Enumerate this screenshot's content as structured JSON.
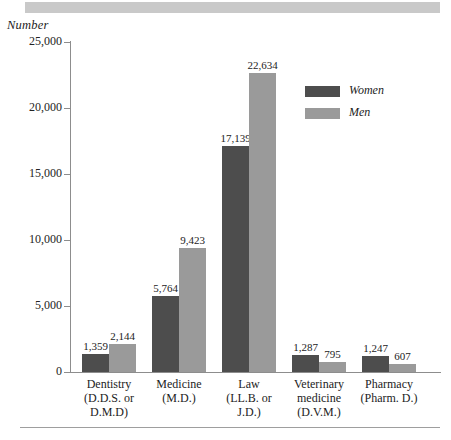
{
  "figure": {
    "axis_title": "Number",
    "top_band_color": "#c9c9c9",
    "bottom_rule_color": "#9e9e9e"
  },
  "legend": {
    "position": "upper-right",
    "entries": [
      {
        "label": "Women",
        "color": "#4d4d4d"
      },
      {
        "label": "Men",
        "color": "#9a9a9a"
      }
    ]
  },
  "yaxis": {
    "ticks": [
      "0",
      "5,000",
      "10,000",
      "15,000",
      "20,000",
      "25,000"
    ],
    "tick_values": [
      0,
      5000,
      10000,
      15000,
      20000,
      25000
    ]
  },
  "categories": [
    {
      "line1": "Dentistry",
      "line2": "(D.D.S. or",
      "line3": "D.M.D)"
    },
    {
      "line1": "Medicine",
      "line2": "(M.D.)",
      "line3": ""
    },
    {
      "line1": "Law",
      "line2": "(LL.B. or",
      "line3": "J.D.)"
    },
    {
      "line1": "Veterinary",
      "line2": "medicine",
      "line3": "(D.V.M.)"
    },
    {
      "line1": "Pharmacy",
      "line2": "(Pharm. D.)",
      "line3": ""
    }
  ],
  "value_labels": {
    "women": [
      "1,359",
      "5,764",
      "17,139",
      "1,287",
      "1,247"
    ],
    "men": [
      "2,144",
      "9,423",
      "22,634",
      "795",
      "607"
    ]
  },
  "chart_data": {
    "type": "bar",
    "title": "",
    "subtitle": "",
    "xlabel": "",
    "ylabel": "Number",
    "ylim": [
      0,
      25000
    ],
    "ytick_step": 5000,
    "grid": false,
    "legend_position": "upper right",
    "categories": [
      "Dentistry (D.D.S. or D.M.D)",
      "Medicine (M.D.)",
      "Law (LL.B. or J.D.)",
      "Veterinary medicine (D.V.M.)",
      "Pharmacy (Pharm. D.)"
    ],
    "series": [
      {
        "name": "Women",
        "color": "#4d4d4d",
        "values": [
          1359,
          5764,
          17139,
          1287,
          1247
        ]
      },
      {
        "name": "Men",
        "color": "#9a9a9a",
        "values": [
          2144,
          9423,
          22634,
          795,
          607
        ]
      }
    ],
    "data_labels": true
  }
}
